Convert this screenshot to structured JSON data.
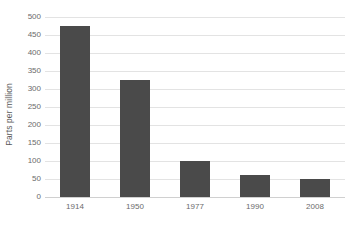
{
  "chart_data": {
    "type": "bar",
    "title": "",
    "xlabel": "",
    "ylabel": "Parts per million",
    "categories": [
      "1914",
      "1950",
      "1977",
      "1990",
      "2008"
    ],
    "values": [
      475,
      325,
      100,
      60,
      50
    ],
    "series": [
      {
        "name": "Parts per million",
        "values": [
          475,
          325,
          100,
          60,
          50
        ]
      }
    ],
    "ylim": [
      0,
      500
    ],
    "ytick_step": 50,
    "ytick_labels": [
      "500",
      "450",
      "400",
      "350",
      "300",
      "250",
      "200",
      "150",
      "100",
      "50",
      "0"
    ],
    "ytick_values": [
      500,
      450,
      400,
      350,
      300,
      250,
      200,
      150,
      100,
      50,
      0
    ],
    "grid": true,
    "grid_axis": "y",
    "legend": false,
    "legend_position": "none",
    "colors": {
      "bar": "#4a4a4a",
      "gridline": "#e3e3e3",
      "baseline": "#d0d0d0",
      "text": "#595959",
      "tick_text": "#6b6b6b",
      "background": "#ffffff"
    }
  }
}
